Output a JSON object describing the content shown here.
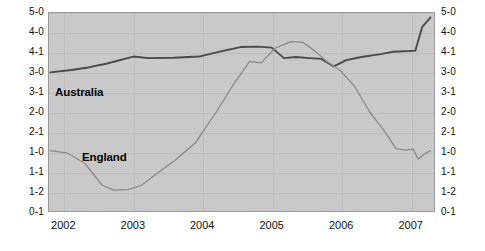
{
  "chart_data": {
    "type": "line",
    "title": "",
    "subtitle": "",
    "xlabel": "",
    "ylabel": "",
    "grid": true,
    "legend_position": "inline-annotations",
    "background_color": "#c9c9c9",
    "x": [
      2002,
      2003,
      2004,
      2005,
      2006,
      2007
    ],
    "xlim": [
      2001.78,
      2007.35
    ],
    "x_tick_labels": [
      "2002",
      "2003",
      "2004",
      "2005",
      "2006",
      "2007"
    ],
    "y_tick_labels": [
      "5-0",
      "4-0",
      "4-1",
      "3-0",
      "3-1",
      "2-0",
      "2-1",
      "1-0",
      "1-1",
      "1-2",
      "0-1"
    ],
    "y_tick_values": [
      10,
      9,
      8,
      7,
      6,
      5,
      4,
      3,
      2,
      1,
      0
    ],
    "ylim": [
      0,
      10
    ],
    "series": [
      {
        "name": "Australia",
        "color": "#4a4a4a",
        "width": 1.9,
        "points": [
          [
            2001.8,
            7.0
          ],
          [
            2002.1,
            7.12
          ],
          [
            2002.35,
            7.25
          ],
          [
            2002.62,
            7.45
          ],
          [
            2003.0,
            7.8
          ],
          [
            2003.22,
            7.72
          ],
          [
            2003.58,
            7.74
          ],
          [
            2003.95,
            7.8
          ],
          [
            2004.25,
            8.05
          ],
          [
            2004.55,
            8.28
          ],
          [
            2004.8,
            8.3
          ],
          [
            2005.0,
            8.25
          ],
          [
            2005.18,
            7.72
          ],
          [
            2005.35,
            7.78
          ],
          [
            2005.55,
            7.72
          ],
          [
            2005.72,
            7.68
          ],
          [
            2005.9,
            7.3
          ],
          [
            2006.08,
            7.62
          ],
          [
            2006.3,
            7.78
          ],
          [
            2006.58,
            7.92
          ],
          [
            2006.75,
            8.04
          ],
          [
            2007.0,
            8.08
          ],
          [
            2007.08,
            8.1
          ],
          [
            2007.18,
            9.3
          ],
          [
            2007.3,
            9.78
          ]
        ]
      },
      {
        "name": "England",
        "color": "#8a8a8a",
        "width": 1.3,
        "points": [
          [
            2001.8,
            3.05
          ],
          [
            2002.05,
            2.92
          ],
          [
            2002.3,
            2.4
          ],
          [
            2002.55,
            1.3
          ],
          [
            2002.72,
            1.05
          ],
          [
            2002.92,
            1.08
          ],
          [
            2003.12,
            1.3
          ],
          [
            2003.35,
            1.92
          ],
          [
            2003.6,
            2.55
          ],
          [
            2003.9,
            3.45
          ],
          [
            2004.2,
            5.0
          ],
          [
            2004.45,
            6.4
          ],
          [
            2004.68,
            7.55
          ],
          [
            2004.85,
            7.48
          ],
          [
            2005.05,
            8.22
          ],
          [
            2005.28,
            8.55
          ],
          [
            2005.45,
            8.52
          ],
          [
            2005.62,
            8.1
          ],
          [
            2005.8,
            7.55
          ],
          [
            2006.0,
            7.08
          ],
          [
            2006.2,
            6.3
          ],
          [
            2006.42,
            5.0
          ],
          [
            2006.62,
            4.1
          ],
          [
            2006.8,
            3.15
          ],
          [
            2006.95,
            3.08
          ],
          [
            2007.05,
            3.12
          ],
          [
            2007.12,
            2.62
          ],
          [
            2007.22,
            2.9
          ],
          [
            2007.3,
            3.05
          ]
        ]
      }
    ],
    "annotations": [
      {
        "text": "Australia",
        "x": 2002.0,
        "y": 7.0
      },
      {
        "text": "England",
        "x": 2002.45,
        "y": 3.0
      }
    ]
  }
}
